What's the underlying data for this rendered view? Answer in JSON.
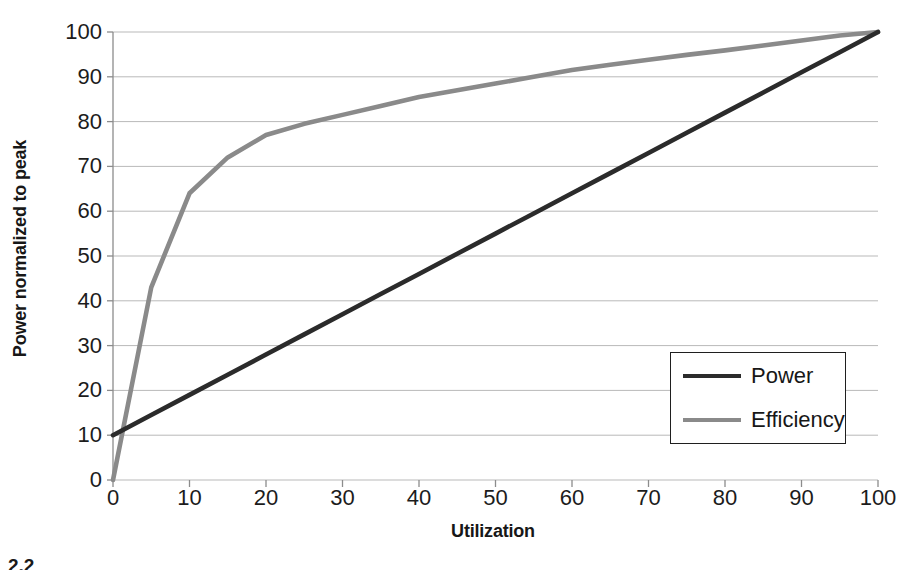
{
  "chart_data": {
    "type": "line",
    "title": "",
    "xlabel": "Utilization",
    "ylabel": "Power normalized to peak",
    "xlim": [
      0,
      100
    ],
    "ylim": [
      0,
      100
    ],
    "xticks": [
      "0",
      "10",
      "20",
      "30",
      "40",
      "50",
      "60",
      "70",
      "80",
      "90",
      "100"
    ],
    "yticks": [
      "0",
      "10",
      "20",
      "30",
      "40",
      "50",
      "60",
      "70",
      "80",
      "90",
      "100"
    ],
    "grid": "horizontal",
    "legend_position": "inside-right-lower",
    "x": [
      0,
      5,
      10,
      15,
      20,
      25,
      30,
      35,
      40,
      45,
      50,
      55,
      60,
      65,
      70,
      75,
      80,
      85,
      90,
      95,
      100
    ],
    "series": [
      {
        "name": "Power",
        "color": "#2b2b2b",
        "values": [
          10,
          14.5,
          19,
          23.5,
          28,
          32.5,
          37,
          41.5,
          46,
          50.5,
          55,
          59.5,
          64,
          68.5,
          73,
          77.5,
          82,
          86.5,
          91,
          95.5,
          100
        ]
      },
      {
        "name": "Efficiency",
        "color": "#8a8a8a",
        "values": [
          0,
          43,
          64,
          72,
          77,
          79.5,
          81.5,
          83.5,
          85.5,
          87,
          88.5,
          90,
          91.5,
          92.7,
          93.8,
          94.9,
          95.9,
          97,
          98.1,
          99.2,
          100
        ]
      }
    ]
  },
  "legend": {
    "items": [
      {
        "label": "Power",
        "color": "#2b2b2b"
      },
      {
        "label": "Efficiency",
        "color": "#8a8a8a"
      }
    ]
  },
  "caption": "2.2"
}
